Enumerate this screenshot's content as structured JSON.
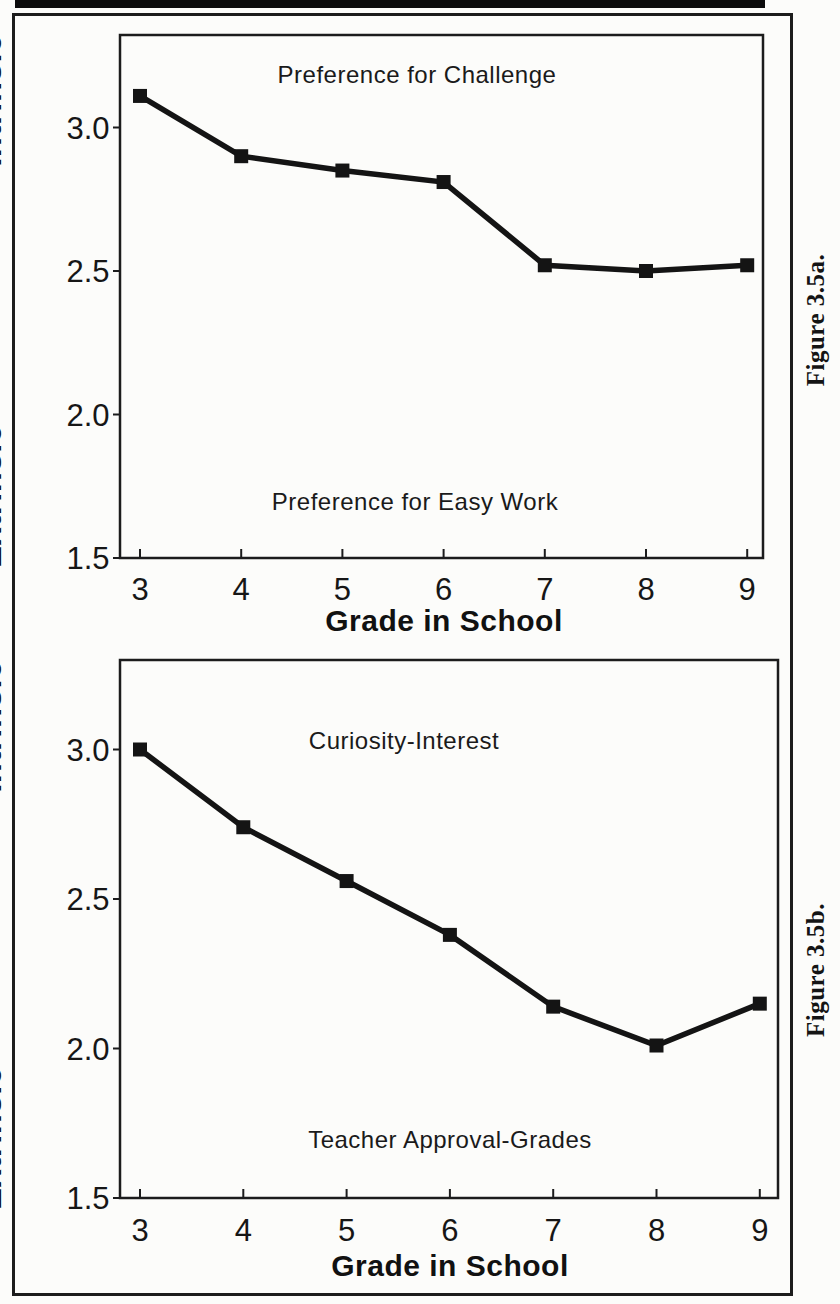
{
  "page": {
    "background": "#fcfcfa",
    "ink": "#161616",
    "description_top_bar": "black scan artifact bar"
  },
  "chart_data": [
    {
      "type": "line",
      "caption": "Figure 3.5a.",
      "annotation_top": "Preference for Challenge",
      "annotation_bottom": "Preference for Easy Work",
      "xlabel": "Grade in School",
      "ylabel_high": "Intrinsic",
      "ylabel_low": "Extrinsic",
      "ylabel_full": "Extrinsic-----------Intrinsic",
      "categories": [
        "3",
        "4",
        "5",
        "6",
        "7",
        "8",
        "9"
      ],
      "x": [
        3,
        4,
        5,
        6,
        7,
        8,
        9
      ],
      "values": [
        3.11,
        2.9,
        2.85,
        2.81,
        2.52,
        2.5,
        2.52
      ],
      "ytick_values": [
        3.0,
        2.5,
        2.0,
        1.5
      ],
      "ytick_labels": [
        "3.0",
        "2.5",
        "2.0",
        "1.5"
      ],
      "ylim": [
        1.5,
        3.32
      ],
      "grid": false,
      "legend": null,
      "marker": "filled-square",
      "line_color": "#141414"
    },
    {
      "type": "line",
      "caption": "Figure 3.5b.",
      "annotation_top": "Curiosity-Interest",
      "annotation_bottom": "Teacher Approval-Grades",
      "xlabel": "Grade in School",
      "ylabel_high": "Intrinsic",
      "ylabel_low": "Extrinsic",
      "ylabel_full": "Extrinsic-----------Intrinsic",
      "categories": [
        "3",
        "4",
        "5",
        "6",
        "7",
        "8",
        "9"
      ],
      "x": [
        3,
        4,
        5,
        6,
        7,
        8,
        9
      ],
      "values": [
        3.0,
        2.74,
        2.56,
        2.38,
        2.14,
        2.01,
        2.15
      ],
      "ytick_values": [
        3.0,
        2.5,
        2.0,
        1.5
      ],
      "ytick_labels": [
        "3.0",
        "2.5",
        "2.0",
        "1.5"
      ],
      "ylim": [
        1.5,
        3.3
      ],
      "grid": false,
      "legend": null,
      "marker": "filled-square",
      "line_color": "#141414"
    }
  ]
}
